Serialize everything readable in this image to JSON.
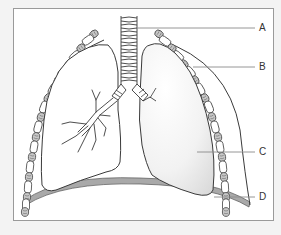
{
  "diagram": {
    "labels": [
      {
        "id": "A",
        "text": "A",
        "x": 261,
        "y": 23
      },
      {
        "id": "B",
        "text": "B",
        "x": 261,
        "y": 62
      },
      {
        "id": "C",
        "text": "C",
        "x": 261,
        "y": 147
      },
      {
        "id": "D",
        "text": "D",
        "x": 261,
        "y": 192
      }
    ],
    "colors": {
      "background": "#f3f3f3",
      "frame_border": "#9a9a9a",
      "outline": "#3a3a3a",
      "leader_line": "#8a8a8a",
      "diaphragm": "#9a9a9a",
      "lung_shade": "#e6e6e6",
      "rib_shade": "#bdbdbd"
    }
  }
}
